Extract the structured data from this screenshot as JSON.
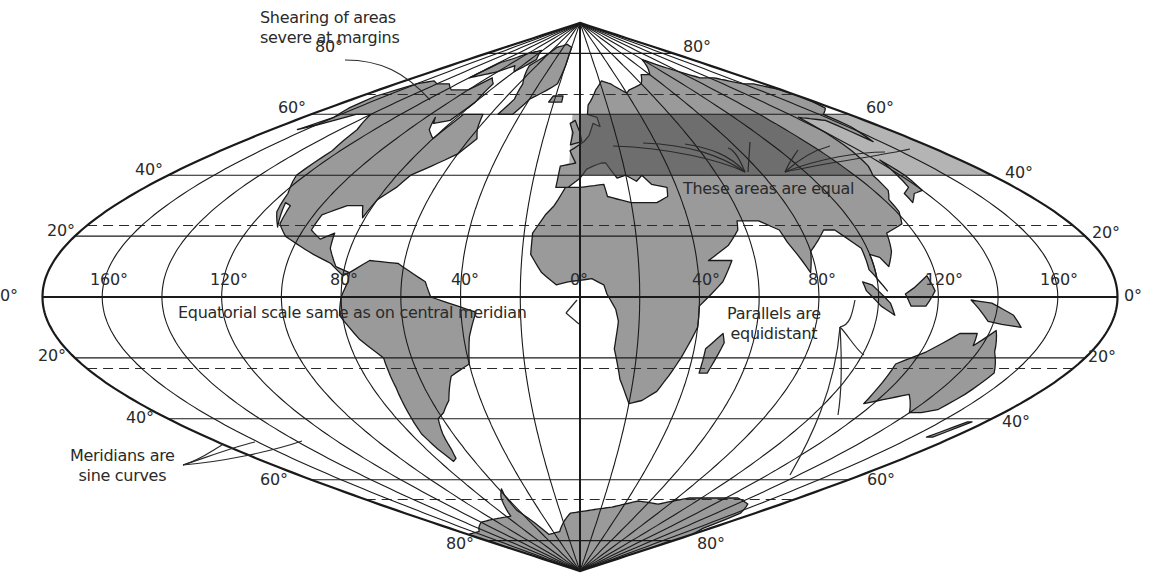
{
  "projection": {
    "type": "sinusoidal",
    "center_x": 580,
    "center_y": 297,
    "half_width_px": 537.5,
    "px_per_degree_lat": 3.045,
    "outline_color": "#1a1a1a",
    "land_fill": "#9a9a9a",
    "land_stroke": "#1a1a1a",
    "highlight_dark": "#7a7a7a",
    "highlight_light": "#b4b4b4"
  },
  "graticule": {
    "parallels_solid": [
      80,
      60,
      40,
      20,
      0,
      -20,
      -40,
      -60,
      -80
    ],
    "parallels_dashed": [
      66.5,
      23.5,
      -23.5,
      -66.5
    ],
    "meridian_step_deg": 20
  },
  "highlight": {
    "lat_min": 40,
    "lat_max": 60,
    "dark_lon_min": 0,
    "dark_lon_max": 120,
    "light_lon_min": -5,
    "light_lon_max": 180
  },
  "labels": {
    "latitude": [
      {
        "text": "80°",
        "x": 315,
        "y": 38
      },
      {
        "text": "80°",
        "x": 683,
        "y": 38
      },
      {
        "text": "60°",
        "x": 278,
        "y": 99
      },
      {
        "text": "60°",
        "x": 866,
        "y": 99
      },
      {
        "text": "40°",
        "x": 135,
        "y": 161
      },
      {
        "text": "40°",
        "x": 1005,
        "y": 164
      },
      {
        "text": "20°",
        "x": 47,
        "y": 222
      },
      {
        "text": "20°",
        "x": 1092,
        "y": 224
      },
      {
        "text": "0°",
        "x": 0,
        "y": 287
      },
      {
        "text": "0°",
        "x": 1124,
        "y": 287
      },
      {
        "text": "20°",
        "x": 38,
        "y": 347
      },
      {
        "text": "20°",
        "x": 1088,
        "y": 348
      },
      {
        "text": "40°",
        "x": 126,
        "y": 409
      },
      {
        "text": "40°",
        "x": 1002,
        "y": 413
      },
      {
        "text": "60°",
        "x": 260,
        "y": 471
      },
      {
        "text": "60°",
        "x": 867,
        "y": 471
      },
      {
        "text": "80°",
        "x": 446,
        "y": 535
      },
      {
        "text": "80°",
        "x": 697,
        "y": 535
      }
    ],
    "longitude": [
      {
        "text": "160°",
        "x": 90,
        "y": 271
      },
      {
        "text": "120°",
        "x": 210,
        "y": 271
      },
      {
        "text": "80°",
        "x": 330,
        "y": 271
      },
      {
        "text": "40°",
        "x": 451,
        "y": 271
      },
      {
        "text": "0°",
        "x": 570,
        "y": 271
      },
      {
        "text": "40°",
        "x": 692,
        "y": 271
      },
      {
        "text": "80°",
        "x": 808,
        "y": 271
      },
      {
        "text": "120°",
        "x": 925,
        "y": 271
      },
      {
        "text": "160°",
        "x": 1040,
        "y": 271
      }
    ]
  },
  "annotations": {
    "shearing": {
      "line1": "Shearing of areas",
      "line2": "severe at margins"
    },
    "equal_areas": "These areas are equal",
    "equatorial_scale": "Equatorial scale same as on central meridian",
    "parallels": {
      "line1": "Parallels are",
      "line2": "equidistant"
    },
    "meridians": {
      "line1": "Meridians are",
      "line2": "sine curves"
    }
  },
  "land": [
    {
      "name": "north-america",
      "pts": [
        [
          -168,
          66
        ],
        [
          -160,
          70
        ],
        [
          -150,
          71
        ],
        [
          -140,
          70
        ],
        [
          -128,
          70
        ],
        [
          -115,
          68
        ],
        [
          -100,
          68
        ],
        [
          -95,
          72
        ],
        [
          -85,
          70
        ],
        [
          -80,
          64
        ],
        [
          -82,
          58
        ],
        [
          -90,
          57
        ],
        [
          -94,
          59
        ],
        [
          -88,
          55
        ],
        [
          -80,
          52
        ],
        [
          -78,
          60
        ],
        [
          -72,
          60
        ],
        [
          -65,
          60
        ],
        [
          -60,
          55
        ],
        [
          -56,
          52
        ],
        [
          -60,
          47
        ],
        [
          -66,
          44
        ],
        [
          -70,
          42
        ],
        [
          -74,
          40
        ],
        [
          -76,
          36
        ],
        [
          -80,
          32
        ],
        [
          -81,
          26
        ],
        [
          -84,
          30
        ],
        [
          -90,
          30
        ],
        [
          -97,
          27
        ],
        [
          -97,
          22
        ],
        [
          -92,
          19
        ],
        [
          -88,
          21
        ],
        [
          -87,
          16
        ],
        [
          -83,
          10
        ],
        [
          -78,
          8
        ],
        [
          -80,
          7
        ],
        [
          -85,
          11
        ],
        [
          -92,
          14
        ],
        [
          -105,
          20
        ],
        [
          -110,
          24
        ],
        [
          -112,
          30
        ],
        [
          -115,
          31
        ],
        [
          -110,
          23
        ],
        [
          -115,
          28
        ],
        [
          -118,
          34
        ],
        [
          -124,
          40
        ],
        [
          -124,
          48
        ],
        [
          -130,
          55
        ],
        [
          -140,
          60
        ],
        [
          -150,
          60
        ],
        [
          -158,
          57
        ],
        [
          -165,
          55
        ],
        [
          -160,
          59
        ],
        [
          -165,
          62
        ]
      ]
    },
    {
      "name": "greenland",
      "pts": [
        [
          -55,
          60
        ],
        [
          -45,
          60
        ],
        [
          -40,
          65
        ],
        [
          -22,
          70
        ],
        [
          -20,
          76
        ],
        [
          -20,
          82
        ],
        [
          -35,
          83
        ],
        [
          -55,
          82
        ],
        [
          -65,
          78
        ],
        [
          -70,
          76
        ],
        [
          -56,
          70
        ],
        [
          -52,
          65
        ]
      ]
    },
    {
      "name": "arctic-islands",
      "pts": [
        [
          -120,
          72
        ],
        [
          -100,
          74
        ],
        [
          -90,
          76
        ],
        [
          -80,
          74
        ],
        [
          -70,
          78
        ],
        [
          -82,
          81
        ],
        [
          -100,
          80
        ],
        [
          -118,
          77
        ]
      ]
    },
    {
      "name": "south-america",
      "pts": [
        [
          -78,
          8
        ],
        [
          -72,
          12
        ],
        [
          -62,
          11
        ],
        [
          -52,
          5
        ],
        [
          -50,
          0
        ],
        [
          -44,
          -2
        ],
        [
          -35,
          -5
        ],
        [
          -38,
          -13
        ],
        [
          -40,
          -22
        ],
        [
          -48,
          -26
        ],
        [
          -53,
          -34
        ],
        [
          -58,
          -38
        ],
        [
          -62,
          -40
        ],
        [
          -65,
          -45
        ],
        [
          -67,
          -50
        ],
        [
          -69,
          -53
        ],
        [
          -72,
          -54
        ],
        [
          -74,
          -50
        ],
        [
          -75,
          -45
        ],
        [
          -73,
          -38
        ],
        [
          -71,
          -30
        ],
        [
          -70,
          -20
        ],
        [
          -76,
          -14
        ],
        [
          -81,
          -6
        ],
        [
          -80,
          0
        ],
        [
          -78,
          5
        ]
      ]
    },
    {
      "name": "eurasia-africa",
      "pts": [
        [
          -10,
          36
        ],
        [
          -9,
          43
        ],
        [
          -2,
          44
        ],
        [
          -5,
          48
        ],
        [
          2,
          51
        ],
        [
          5,
          53
        ],
        [
          8,
          57
        ],
        [
          12,
          56
        ],
        [
          11,
          59
        ],
        [
          5,
          60
        ],
        [
          6,
          63
        ],
        [
          14,
          68
        ],
        [
          22,
          71
        ],
        [
          30,
          70
        ],
        [
          40,
          67
        ],
        [
          44,
          68
        ],
        [
          60,
          70
        ],
        [
          70,
          73
        ],
        [
          80,
          73
        ],
        [
          100,
          78
        ],
        [
          110,
          76
        ],
        [
          130,
          72
        ],
        [
          145,
          72
        ],
        [
          160,
          70
        ],
        [
          170,
          70
        ],
        [
          180,
          68
        ],
        [
          180,
          65
        ],
        [
          175,
          62
        ],
        [
          163,
          60
        ],
        [
          162,
          56
        ],
        [
          156,
          51
        ],
        [
          155,
          58
        ],
        [
          142,
          59
        ],
        [
          140,
          54
        ],
        [
          136,
          48
        ],
        [
          132,
          43
        ],
        [
          128,
          40
        ],
        [
          126,
          35
        ],
        [
          122,
          32
        ],
        [
          121,
          28
        ],
        [
          118,
          24
        ],
        [
          110,
          21
        ],
        [
          108,
          15
        ],
        [
          105,
          10
        ],
        [
          103,
          13
        ],
        [
          100,
          14
        ],
        [
          100,
          6
        ],
        [
          103,
          2
        ],
        [
          98,
          9
        ],
        [
          98,
          16
        ],
        [
          92,
          22
        ],
        [
          88,
          22
        ],
        [
          80,
          15
        ],
        [
          78,
          8
        ],
        [
          73,
          18
        ],
        [
          72,
          22
        ],
        [
          66,
          25
        ],
        [
          58,
          25
        ],
        [
          57,
          22
        ],
        [
          52,
          17
        ],
        [
          44,
          12
        ],
        [
          52,
          12
        ],
        [
          48,
          5
        ],
        [
          40,
          -3
        ],
        [
          40,
          -10
        ],
        [
          36,
          -20
        ],
        [
          33,
          -26
        ],
        [
          30,
          -31
        ],
        [
          25,
          -34
        ],
        [
          20,
          -35
        ],
        [
          18,
          -32
        ],
        [
          15,
          -27
        ],
        [
          12,
          -17
        ],
        [
          13,
          -8
        ],
        [
          12,
          -4
        ],
        [
          9,
          1
        ],
        [
          8,
          4
        ],
        [
          4,
          6
        ],
        [
          -4,
          5
        ],
        [
          -8,
          4
        ],
        [
          -13,
          8
        ],
        [
          -17,
          14
        ],
        [
          -17,
          21
        ],
        [
          -13,
          27
        ],
        [
          -10,
          30
        ],
        [
          -6,
          36
        ],
        [
          0,
          36
        ],
        [
          10,
          37
        ],
        [
          11,
          33
        ],
        [
          20,
          31
        ],
        [
          30,
          31
        ],
        [
          35,
          33
        ],
        [
          36,
          36
        ],
        [
          30,
          37
        ],
        [
          27,
          40
        ],
        [
          24,
          38
        ],
        [
          20,
          40
        ],
        [
          16,
          39
        ],
        [
          12,
          44
        ],
        [
          10,
          44
        ],
        [
          6,
          43
        ],
        [
          3,
          42
        ],
        [
          0,
          39
        ],
        [
          -5,
          36
        ]
      ]
    },
    {
      "name": "arabia-sea-gap",
      "pts": []
    },
    {
      "name": "madagascar",
      "pts": [
        [
          44,
          -25
        ],
        [
          47,
          -25
        ],
        [
          50,
          -15
        ],
        [
          49,
          -12
        ],
        [
          44,
          -17
        ]
      ]
    },
    {
      "name": "great-britain",
      "pts": [
        [
          -5,
          50
        ],
        [
          1,
          51
        ],
        [
          0,
          54
        ],
        [
          -3,
          58
        ],
        [
          -6,
          57
        ],
        [
          -4,
          54
        ]
      ]
    },
    {
      "name": "iceland",
      "pts": [
        [
          -24,
          64
        ],
        [
          -14,
          64
        ],
        [
          -14,
          66
        ],
        [
          -22,
          66
        ]
      ]
    },
    {
      "name": "japan",
      "pts": [
        [
          130,
          31
        ],
        [
          135,
          34
        ],
        [
          140,
          35
        ],
        [
          142,
          40
        ],
        [
          142,
          45
        ],
        [
          140,
          42
        ],
        [
          136,
          36
        ],
        [
          131,
          34
        ]
      ]
    },
    {
      "name": "borneo",
      "pts": [
        [
          109,
          1
        ],
        [
          112,
          3
        ],
        [
          117,
          7
        ],
        [
          119,
          2
        ],
        [
          116,
          -3
        ],
        [
          111,
          -3
        ]
      ]
    },
    {
      "name": "sumatra",
      "pts": [
        [
          95,
          5
        ],
        [
          98,
          4
        ],
        [
          104,
          -2
        ],
        [
          106,
          -6
        ],
        [
          101,
          -3
        ],
        [
          96,
          2
        ]
      ]
    },
    {
      "name": "new-guinea",
      "pts": [
        [
          131,
          -1
        ],
        [
          138,
          -2
        ],
        [
          146,
          -6
        ],
        [
          150,
          -10
        ],
        [
          143,
          -9
        ],
        [
          138,
          -8
        ],
        [
          134,
          -4
        ]
      ]
    },
    {
      "name": "australia",
      "pts": [
        [
          114,
          -22
        ],
        [
          122,
          -18
        ],
        [
          130,
          -12
        ],
        [
          136,
          -12
        ],
        [
          137,
          -16
        ],
        [
          142,
          -11
        ],
        [
          146,
          -18
        ],
        [
          153,
          -25
        ],
        [
          152,
          -32
        ],
        [
          150,
          -37
        ],
        [
          145,
          -38
        ],
        [
          140,
          -38
        ],
        [
          135,
          -35
        ],
        [
          130,
          -32
        ],
        [
          116,
          -35
        ],
        [
          115,
          -30
        ]
      ]
    },
    {
      "name": "new-zealand",
      "pts": [
        [
          167,
          -46
        ],
        [
          172,
          -41
        ],
        [
          174,
          -41
        ],
        [
          170,
          -46
        ]
      ]
    },
    {
      "name": "antarctica",
      "pts": [
        [
          -180,
          -78
        ],
        [
          -150,
          -77
        ],
        [
          -120,
          -74
        ],
        [
          -100,
          -73
        ],
        [
          -75,
          -72
        ],
        [
          -65,
          -66
        ],
        [
          -58,
          -63
        ],
        [
          -60,
          -65
        ],
        [
          -62,
          -70
        ],
        [
          -50,
          -78
        ],
        [
          -30,
          -77
        ],
        [
          -10,
          -71
        ],
        [
          10,
          -70
        ],
        [
          30,
          -69
        ],
        [
          50,
          -67
        ],
        [
          70,
          -68
        ],
        [
          90,
          -66
        ],
        [
          110,
          -66
        ],
        [
          130,
          -66
        ],
        [
          150,
          -68
        ],
        [
          165,
          -71
        ],
        [
          170,
          -76
        ],
        [
          180,
          -78
        ],
        [
          180,
          -90
        ],
        [
          -180,
          -90
        ]
      ]
    }
  ]
}
